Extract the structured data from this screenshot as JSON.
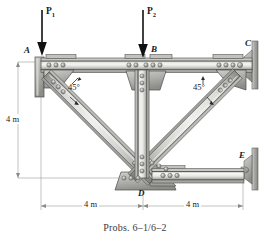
{
  "figure": {
    "caption": "Probs. 6–1/6–2",
    "background": "#ffffff"
  },
  "forces": [
    {
      "name": "P1",
      "label": "P",
      "sub": "1",
      "arrow": "down-arrow-icon"
    },
    {
      "name": "P2",
      "label": "P",
      "sub": "2",
      "arrow": "down-arrow-icon"
    }
  ],
  "joints": [
    {
      "id": "A",
      "label": "A"
    },
    {
      "id": "B",
      "label": "B"
    },
    {
      "id": "C",
      "label": "C"
    },
    {
      "id": "D",
      "label": "D"
    },
    {
      "id": "E",
      "label": "E"
    }
  ],
  "angles": [
    {
      "id": "left",
      "label": "45°"
    },
    {
      "id": "right",
      "label": "45°"
    }
  ],
  "dimensions": [
    {
      "id": "vertical-height",
      "label": "4 m",
      "orientation": "vertical"
    },
    {
      "id": "bottom-left-span",
      "label": "4 m",
      "orientation": "horizontal"
    },
    {
      "id": "bottom-right-span",
      "label": "4 m",
      "orientation": "horizontal"
    }
  ],
  "colors": {
    "steel_light": "#e3e3e1",
    "steel_mid": "#c6c6c2",
    "steel_dark": "#9a9a96",
    "steel_shadow": "#7d7d79",
    "outline": "#4a4a48",
    "bolt": "#8d8d89",
    "wall": "#b8b8b4",
    "ink": "#1a1a1a",
    "dim_line": "#8a8a88"
  }
}
